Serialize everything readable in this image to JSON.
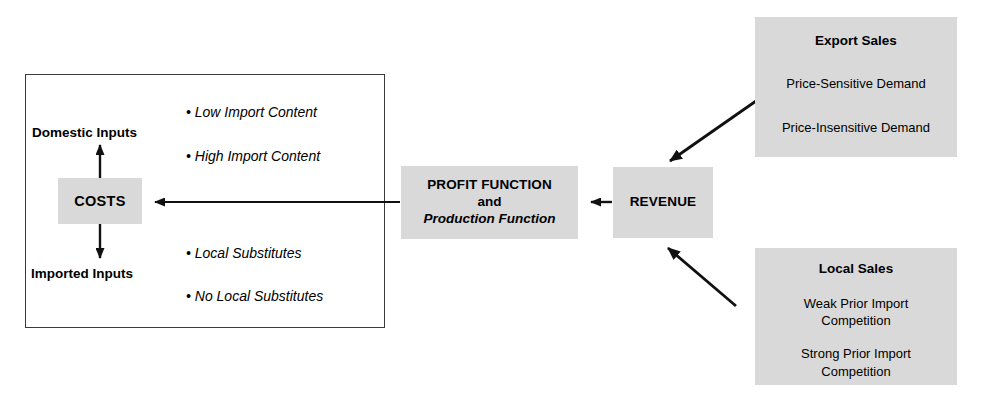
{
  "diagram": {
    "colors": {
      "node_fill": "#d9d9d9",
      "outline": "#3a3a3a",
      "arrow": "#111111",
      "text": "#000000",
      "background": "#ffffff"
    },
    "group_box": {
      "name": "costs-group-box"
    },
    "nodes": {
      "costs": {
        "label": "COSTS"
      },
      "profit": {
        "line1": "PROFIT FUNCTION",
        "line2": "and",
        "line3": "Production Function"
      },
      "revenue": {
        "label": "REVENUE"
      },
      "export_sales": {
        "title": "Export Sales",
        "items": [
          "Price-Sensitive Demand",
          "Price-Insensitive Demand"
        ]
      },
      "local_sales": {
        "title": "Local Sales",
        "items": [
          "Weak Prior Import\nCompetition",
          "Strong Prior Import\nCompetition"
        ],
        "item1_line1": "Weak Prior Import",
        "item1_line2": "Competition",
        "item2_line1": "Strong Prior Import",
        "item2_line2": "Competition"
      }
    },
    "labels": {
      "domestic_inputs": "Domestic Inputs",
      "imported_inputs": "Imported Inputs"
    },
    "bullets": {
      "domestic": [
        "• Low Import Content",
        "• High Import Content"
      ],
      "imported": [
        "• Local Substitutes",
        "• No Local Substitutes"
      ],
      "b1": "• Low Import Content",
      "b2": "• High Import Content",
      "b3": "• Local Substitutes",
      "b4": "• No Local Substitutes"
    },
    "arrows": [
      {
        "name": "revenue-to-profit",
        "from": "REVENUE",
        "to": "PROFIT FUNCTION",
        "direction": "left"
      },
      {
        "name": "profit-to-costs",
        "from": "PROFIT FUNCTION",
        "to": "COSTS",
        "direction": "left"
      },
      {
        "name": "costs-to-domestic-inputs",
        "from": "COSTS",
        "to": "Domestic Inputs",
        "direction": "up"
      },
      {
        "name": "costs-to-imported-inputs",
        "from": "COSTS",
        "to": "Imported Inputs",
        "direction": "down"
      },
      {
        "name": "export-sales-to-revenue",
        "from": "Export Sales",
        "to": "REVENUE",
        "direction": "down-left"
      },
      {
        "name": "local-sales-to-revenue",
        "from": "Local Sales",
        "to": "REVENUE",
        "direction": "up-left"
      }
    ]
  }
}
